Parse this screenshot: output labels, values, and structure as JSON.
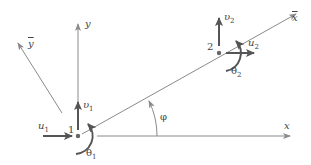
{
  "diagram": {
    "colors": {
      "axis": "#8a8a8a",
      "vector": "#555555",
      "node": "#666666",
      "text": "#444444"
    },
    "axes": {
      "x": {
        "label": "x"
      },
      "y": {
        "label": "y"
      },
      "x_bar": {
        "label": "x"
      },
      "y_bar": {
        "label": "y"
      }
    },
    "angle": {
      "label": "φ"
    },
    "nodes": [
      {
        "id": "1",
        "label": "1",
        "u": {
          "sym": "u",
          "sub": "1"
        },
        "v": {
          "sym": "υ",
          "sub": "1"
        },
        "theta": {
          "sym": "θ",
          "sub": "1"
        }
      },
      {
        "id": "2",
        "label": "2",
        "u": {
          "sym": "u",
          "sub": "2"
        },
        "v": {
          "sym": "υ",
          "sub": "2"
        },
        "theta": {
          "sym": "θ",
          "sub": "2"
        }
      }
    ]
  }
}
